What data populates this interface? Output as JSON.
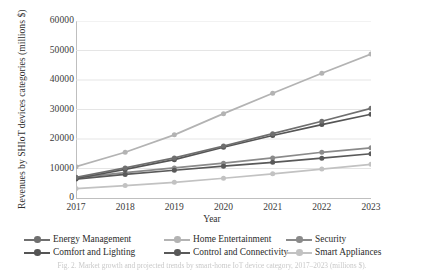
{
  "axes": {
    "y_title": "Revenues by SHIoT devices categories (millions $)",
    "x_title": "Year",
    "y_ticks": [
      "0",
      "10000",
      "20000",
      "30000",
      "40000",
      "50000",
      "60000"
    ],
    "x_ticks": [
      "2017",
      "2018",
      "2019",
      "2020",
      "2021",
      "2022",
      "2023"
    ]
  },
  "legend": {
    "items": [
      {
        "label": "Energy Management",
        "color": "#6f6f6f"
      },
      {
        "label": "Comfort and Lighting",
        "color": "#555555"
      },
      {
        "label": "Home Entertainment",
        "color": "#b3b3b3"
      },
      {
        "label": "Control and Connectivity",
        "color": "#595959"
      },
      {
        "label": "Security",
        "color": "#8a8a8a"
      },
      {
        "label": "Smart Appliances",
        "color": "#c2c2c2"
      }
    ]
  },
  "caption": {
    "text": "Fig. 2.  Market growth and projected trends by smart-home IoT device category, 2017–2023 (millions $)."
  },
  "chart_data": {
    "type": "line",
    "title": "",
    "xlabel": "Year",
    "ylabel": "Revenues by SHIoT devices categories (millions $)",
    "categories": [
      "2017",
      "2018",
      "2019",
      "2020",
      "2021",
      "2022",
      "2023"
    ],
    "ylim": [
      0,
      60000
    ],
    "ytick_step": 10000,
    "grid": "horizontal",
    "legend_position": "bottom",
    "series": [
      {
        "name": "Energy Management",
        "color": "#6f6f6f",
        "values": [
          7000,
          10200,
          13600,
          17600,
          21800,
          26000,
          30400
        ]
      },
      {
        "name": "Comfort and Lighting",
        "color": "#555555",
        "values": [
          6600,
          9700,
          13000,
          17200,
          21200,
          24900,
          28400
        ]
      },
      {
        "name": "Home Entertainment",
        "color": "#b3b3b3",
        "values": [
          10600,
          15500,
          21400,
          28600,
          35500,
          42300,
          48800
        ]
      },
      {
        "name": "Control and Connectivity",
        "color": "#595959",
        "values": [
          6400,
          8000,
          9400,
          10800,
          12100,
          13500,
          15000
        ]
      },
      {
        "name": "Security",
        "color": "#8a8a8a",
        "values": [
          6900,
          8600,
          10200,
          11800,
          13600,
          15500,
          17000
        ]
      },
      {
        "name": "Smart Appliances",
        "color": "#c2c2c2",
        "values": [
          3200,
          4200,
          5300,
          6700,
          8200,
          9800,
          11400
        ]
      }
    ]
  }
}
